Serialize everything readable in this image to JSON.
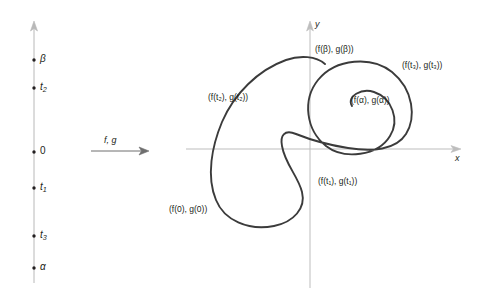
{
  "figure": {
    "background_color": "#ffffff",
    "ink_color": "#231f20",
    "axis_color": "#b3b3b3",
    "curve_color": "#3b3b3b"
  },
  "domain_line": {
    "name": "parameter-interval",
    "orientation": "vertical",
    "arrow_top": true,
    "ticks": [
      {
        "id": "beta",
        "label": "β",
        "y": 60,
        "italic": true
      },
      {
        "id": "t2",
        "label": "t",
        "sub": "2",
        "y": 88,
        "italic": true
      },
      {
        "id": "zero",
        "label": "0",
        "y": 152,
        "italic": false
      },
      {
        "id": "t1",
        "label": "t",
        "sub": "1",
        "y": 188,
        "italic": true
      },
      {
        "id": "t3",
        "label": "t",
        "sub": "3",
        "y": 236,
        "italic": true
      },
      {
        "id": "alpha",
        "label": "α",
        "y": 268,
        "italic": true
      }
    ]
  },
  "mapping_arrow": {
    "label": "f, g",
    "direction": "right"
  },
  "plane": {
    "x_axis_label": "x",
    "y_axis_label": "y",
    "origin": {
      "x": 310,
      "y": 149
    }
  },
  "point_labels": [
    {
      "id": "f-beta",
      "text": "(f(β), g(β))",
      "x": 315,
      "y": 45
    },
    {
      "id": "f-t2",
      "text": "(f(t₂), g(t₂))",
      "x": 208,
      "y": 93
    },
    {
      "id": "f-t3",
      "text": "(f(t₃), g(t₃))",
      "x": 402,
      "y": 61
    },
    {
      "id": "f-alpha",
      "text": "(f(α), g(α))",
      "x": 351,
      "y": 96
    },
    {
      "id": "f-t1",
      "text": "(f(t₁), g(t₁))",
      "x": 318,
      "y": 177
    },
    {
      "id": "f-0",
      "text": "(f(0), g(0))",
      "x": 169,
      "y": 205
    }
  ],
  "chart_data": {
    "type": "line",
    "title": "",
    "xlabel": "x",
    "ylabel": "y",
    "grid": false,
    "legend": null,
    "annotations": [
      "(f(β), g(β))",
      "(f(t₂), g(t₂))",
      "(f(t₃), g(t₃))",
      "(f(α), g(α))",
      "(f(t₁), g(t₁))",
      "(f(0), g(0))"
    ],
    "parameter_ticks": [
      "β",
      "t₂",
      "0",
      "t₁",
      "t₃",
      "α"
    ],
    "curve_path": "M 352,106 C 346,96 362,88 374,92 C 392,98 400,120 390,136 C 378,156 344,160 326,146 C 306,130 302,100 318,80 C 336,58 372,56 392,72 C 414,90 416,118 406,134 C 396,150 372,152 348,148 C 322,144 306,138 296,134 C 284,129 280,136 282,146 C 285,164 298,176 302,192 C 306,208 294,222 274,226 C 248,231 224,220 216,200 C 206,176 212,146 222,122 C 234,94 258,70 286,60 C 300,55 316,56 325,64"
  }
}
